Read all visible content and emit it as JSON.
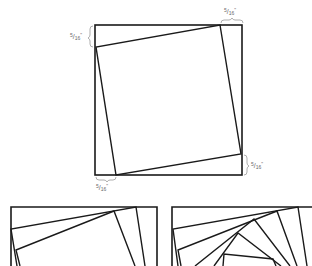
{
  "figure": {
    "main_square": {
      "description": "Outer square with rotated inner square (first round)",
      "dimension_labels": {
        "top_right": {
          "numerator": "5",
          "denominator": "16",
          "unit": "\""
        },
        "left_top": {
          "numerator": "5",
          "denominator": "16",
          "unit": "\""
        },
        "right_bottom": {
          "numerator": "5",
          "denominator": "16",
          "unit": "\""
        },
        "bottom_left": {
          "numerator": "5",
          "denominator": "16",
          "unit": "\""
        }
      }
    },
    "panels": [
      {
        "name": "second-round",
        "description": "Two rounds of rotated squares (partial view)"
      },
      {
        "name": "multiple-rounds",
        "description": "Many rounds of rotated squares forming spiral (partial view)"
      }
    ],
    "colors": {
      "line": "#1a1a1a",
      "brace": "#9a9a9a",
      "label": "#6a6a6a"
    }
  }
}
